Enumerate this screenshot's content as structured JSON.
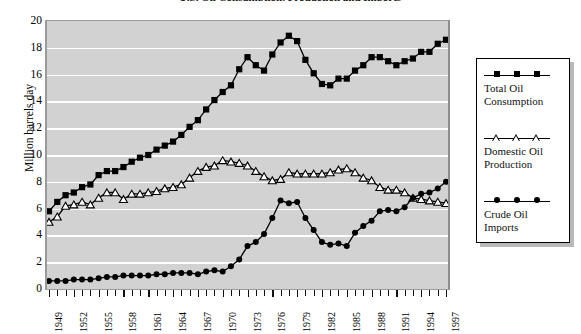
{
  "chart_data": {
    "type": "line",
    "title": "U.S. Oil Consumption, Production and Imports",
    "xlabel": "",
    "ylabel": "Million barrels day",
    "ylim": [
      0,
      20
    ],
    "ytick_values": [
      0,
      2,
      4,
      6,
      8,
      10,
      12,
      14,
      16,
      18,
      20
    ],
    "ytick_labels": [
      "0",
      "2",
      "4",
      "6",
      "8",
      "10",
      "12",
      "14",
      "16",
      "18",
      "20"
    ],
    "grid": true,
    "legend_position": "right",
    "x": [
      1949,
      1950,
      1951,
      1952,
      1953,
      1954,
      1955,
      1956,
      1957,
      1958,
      1959,
      1960,
      1961,
      1962,
      1963,
      1964,
      1965,
      1966,
      1967,
      1968,
      1969,
      1970,
      1971,
      1972,
      1973,
      1974,
      1975,
      1976,
      1977,
      1978,
      1979,
      1980,
      1981,
      1982,
      1983,
      1984,
      1985,
      1986,
      1987,
      1988,
      1989,
      1990,
      1991,
      1992,
      1993,
      1994,
      1995,
      1996,
      1997
    ],
    "xtick_labels": [
      "1949",
      "1952",
      "1955",
      "1958",
      "1961",
      "1964",
      "1967",
      "1970",
      "1973",
      "1976",
      "1979",
      "1982",
      "1985",
      "1988",
      "1991",
      "1994",
      "1997"
    ],
    "series": [
      {
        "name": "Total Oil Consumption",
        "marker": "filled-square",
        "color": "#000000",
        "values": [
          5.8,
          6.5,
          7.0,
          7.2,
          7.6,
          7.8,
          8.5,
          8.8,
          8.8,
          9.1,
          9.5,
          9.8,
          10.0,
          10.4,
          10.7,
          11.0,
          11.5,
          12.1,
          12.6,
          13.4,
          14.1,
          14.7,
          15.2,
          16.4,
          17.3,
          16.7,
          16.3,
          17.5,
          18.4,
          18.9,
          18.5,
          17.1,
          16.1,
          15.3,
          15.2,
          15.7,
          15.7,
          16.3,
          16.7,
          17.3,
          17.3,
          17.0,
          16.7,
          17.0,
          17.2,
          17.7,
          17.7,
          18.3,
          18.6
        ]
      },
      {
        "name": "Domestic Oil Production",
        "marker": "open-triangle",
        "color": "#000000",
        "values": [
          5.0,
          5.4,
          6.2,
          6.3,
          6.5,
          6.3,
          6.8,
          7.2,
          7.2,
          6.7,
          7.1,
          7.1,
          7.2,
          7.3,
          7.5,
          7.6,
          7.8,
          8.3,
          8.8,
          9.1,
          9.2,
          9.6,
          9.5,
          9.4,
          9.2,
          8.8,
          8.4,
          8.1,
          8.2,
          8.7,
          8.6,
          8.6,
          8.6,
          8.6,
          8.7,
          8.9,
          9.0,
          8.7,
          8.3,
          8.1,
          7.6,
          7.4,
          7.4,
          7.2,
          6.8,
          6.7,
          6.6,
          6.5,
          6.4
        ]
      },
      {
        "name": "Crude Oil Imports",
        "marker": "filled-circle",
        "color": "#000000",
        "values": [
          0.6,
          0.6,
          0.6,
          0.7,
          0.7,
          0.7,
          0.8,
          0.9,
          0.9,
          1.0,
          1.0,
          1.0,
          1.0,
          1.1,
          1.1,
          1.2,
          1.2,
          1.2,
          1.1,
          1.3,
          1.4,
          1.3,
          1.7,
          2.2,
          3.2,
          3.5,
          4.1,
          5.3,
          6.6,
          6.4,
          6.5,
          5.3,
          4.4,
          3.5,
          3.3,
          3.4,
          3.2,
          4.2,
          4.7,
          5.1,
          5.8,
          5.9,
          5.8,
          6.1,
          6.8,
          7.1,
          7.2,
          7.5,
          8.0
        ]
      }
    ]
  },
  "legend": {
    "entries": [
      {
        "label_line1": "Total Oil",
        "label_line2": "Consumption"
      },
      {
        "label_line1": "Domestic Oil",
        "label_line2": "Production"
      },
      {
        "label_line1": "Crude Oil",
        "label_line2": "Imports"
      }
    ]
  }
}
